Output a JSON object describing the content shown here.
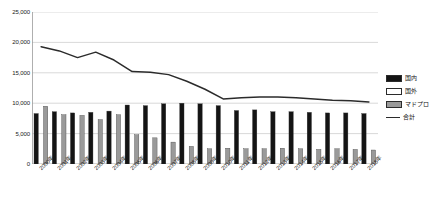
{
  "chart_data": {
    "type": "bar",
    "title": "",
    "subtitle": "",
    "xlabel": "",
    "ylabel": "",
    "ylim": [
      0,
      25000
    ],
    "ytick_values": [
      0,
      5000,
      10000,
      15000,
      20000,
      25000
    ],
    "ytick_labels": [
      "0",
      "5,000",
      "10,000",
      "15,000",
      "20,000",
      "25,000"
    ],
    "grid": true,
    "legend_position": "right",
    "categories": [
      "2000年",
      "2001年",
      "2002年",
      "2003年",
      "2004年",
      "2005年",
      "2006年",
      "2007年",
      "2008年",
      "2009年",
      "2010年",
      "2011年",
      "2012年",
      "2013年",
      "2014年",
      "2015年",
      "2016年",
      "2017年",
      "2018年"
    ],
    "series": [
      {
        "name": "国内",
        "kind": "bar",
        "color": "#141414",
        "values": [
          8300,
          8600,
          8400,
          8500,
          8700,
          9700,
          9600,
          9900,
          10000,
          9900,
          9600,
          8800,
          8900,
          8600,
          8600,
          8500,
          8400,
          8400,
          8300
        ]
      },
      {
        "name": "国外",
        "kind": "bar",
        "color": "#ffffff",
        "values": [
          0,
          0,
          0,
          0,
          0,
          0,
          0,
          0,
          0,
          0,
          0,
          0,
          0,
          0,
          0,
          0,
          0,
          0,
          0
        ]
      },
      {
        "name": "マドプロ",
        "kind": "bar",
        "color": "#9a9a9a",
        "values": [
          9500,
          8100,
          8000,
          7300,
          8100,
          4800,
          4300,
          3600,
          2900,
          2500,
          2600,
          2500,
          2500,
          2600,
          2500,
          2400,
          2500,
          2400,
          2300
        ]
      },
      {
        "name": "合計",
        "kind": "line",
        "color": "#2b2b2b",
        "values": [
          19300,
          18600,
          17500,
          18400,
          17100,
          15200,
          15100,
          14700,
          13600,
          12300,
          10700,
          10900,
          11000,
          11000,
          10900,
          10700,
          10500,
          10400,
          10200
        ]
      }
    ]
  },
  "legend": {
    "items": [
      {
        "label": "国内",
        "swatch": "solid-dark"
      },
      {
        "label": "国外",
        "swatch": "outline-white"
      },
      {
        "label": "マドプロ",
        "swatch": "solid-gray"
      },
      {
        "label": "合計",
        "swatch": "line-dark"
      }
    ]
  }
}
